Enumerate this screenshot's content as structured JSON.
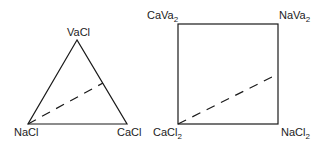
{
  "triangle": {
    "top": "VaCl",
    "bottom_left": "NaCl",
    "bottom_right": "CaCl"
  },
  "square": {
    "top_left": {
      "base": "CaVa",
      "sub": "2"
    },
    "top_right": {
      "base": "NaVa",
      "sub": "2"
    },
    "bottom_left": {
      "base": "CaCl",
      "sub": "2"
    },
    "bottom_right": {
      "base": "NaCl",
      "sub": "2"
    }
  },
  "colors": {
    "line": "#1a1a1a",
    "background": "#ffffff"
  }
}
